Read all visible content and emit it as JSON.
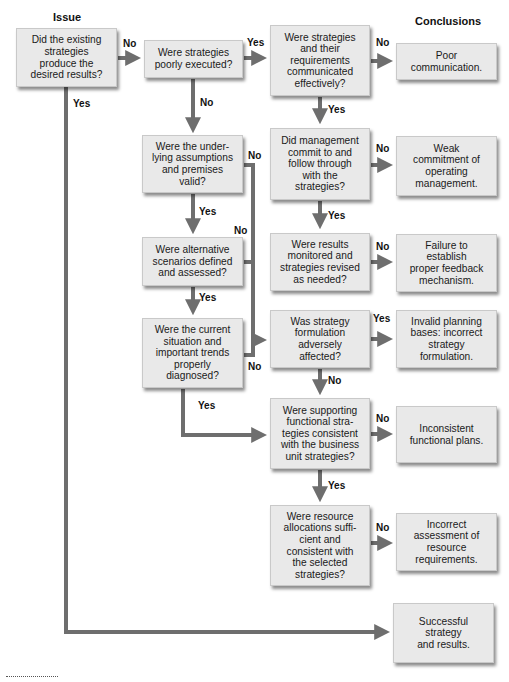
{
  "headers": {
    "issue": "Issue",
    "conclusions": "Conclusions"
  },
  "nodes": {
    "q_existing": "Did the existing\nstrategies\nproduce the\ndesired results?",
    "q_poorly": "Were strategies\npoorly executed?",
    "q_communicated": "Were strategies\nand their\nrequirements\ncommunicated\neffectively?",
    "c_poor_comm": "Poor\ncommunication.",
    "q_assumptions": "Were the under-\nlying assumptions\nand premises\nvalid?",
    "q_management": "Did management\ncommit to and\nfollow through\nwith the\nstrategies?",
    "c_weak_commit": "Weak\ncommitment of\noperating\nmanagement.",
    "q_alternatives": "Were alternative\nscenarios defined\nand assessed?",
    "q_monitored": "Were results\nmonitored and\nstrategies revised\nas needed?",
    "c_feedback": "Failure to\nestablish\nproper feedback\nmechanism.",
    "q_situation": "Were the current\nsituation and\nimportant trends\nproperly\ndiagnosed?",
    "q_formulation": "Was strategy\nformulation\nadversely\naffected?",
    "c_invalid": "Invalid planning\nbases: incorrect\nstrategy\nformulation.",
    "q_functional": "Were supporting\nfunctional stra-\ntegies consistent\nwith the business\nunit strategies?",
    "c_inconsistent": "Inconsistent\nfunctional plans.",
    "q_resources": "Were resource\nallocations suffi-\ncient and\nconsistent with\nthe selected\nstrategies?",
    "c_resource": "Incorrect\nassessment of\nresource\nrequirements.",
    "c_success": "Successful\nstrategy\nand results."
  },
  "edge_labels": {
    "existing_no": "No",
    "existing_yes": "Yes",
    "poorly_yes": "Yes",
    "poorly_no": "No",
    "communicated_no": "No",
    "communicated_yes": "Yes",
    "assumptions_no": "No",
    "assumptions_yes": "Yes",
    "management_no": "No",
    "management_yes": "Yes",
    "alternatives_no": "No",
    "alternatives_yes": "Yes",
    "monitored_no": "No",
    "situation_no": "No",
    "situation_yes": "Yes",
    "formulation_yes": "Yes",
    "formulation_no": "No",
    "functional_no": "No",
    "functional_yes": "Yes",
    "resources_no": "No"
  },
  "colors": {
    "box_fill": "#e9e9e9",
    "connector": "#6e6e6e"
  }
}
